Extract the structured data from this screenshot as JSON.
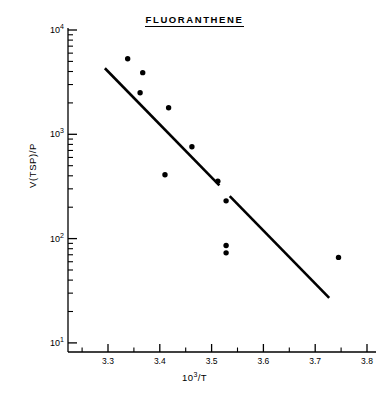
{
  "chart_data": {
    "type": "scatter",
    "title": "FLUORANTHENE",
    "xlabel_base": "10",
    "xlabel_exp": "3",
    "xlabel_tail": "/T",
    "xlabel": "10^3/T",
    "ylabel": "V(TSP)/P",
    "xlim": [
      3.24,
      3.83
    ],
    "ylim": [
      10,
      10000
    ],
    "yscale": "log",
    "xscale": "linear",
    "grid": false,
    "legend": null,
    "xticks": [
      "3.3",
      "3.4",
      "3.5",
      "3.6",
      "3.7",
      "3.8"
    ],
    "xtick_values": [
      3.3,
      3.4,
      3.5,
      3.6,
      3.7,
      3.8
    ],
    "ytick_bases": [
      "10",
      "10",
      "10",
      "10"
    ],
    "ytick_exponents": [
      "1",
      "2",
      "3",
      "4"
    ],
    "ytick_values": [
      10,
      100,
      1000,
      10000
    ],
    "points": [
      {
        "x": 3.338,
        "y": 5300
      },
      {
        "x": 3.367,
        "y": 3900
      },
      {
        "x": 3.362,
        "y": 2500
      },
      {
        "x": 3.417,
        "y": 1800
      },
      {
        "x": 3.41,
        "y": 410
      },
      {
        "x": 3.462,
        "y": 760
      },
      {
        "x": 3.512,
        "y": 355
      },
      {
        "x": 3.528,
        "y": 230
      },
      {
        "x": 3.528,
        "y": 86
      },
      {
        "x": 3.528,
        "y": 73
      },
      {
        "x": 3.745,
        "y": 66
      }
    ],
    "fit_line": {
      "x_start": 3.294,
      "y_start": 4300,
      "x_end": 3.727,
      "y_end": 27,
      "style": "solid-with-gap",
      "gap_x_start": 3.515,
      "gap_x_end": 3.535
    }
  }
}
